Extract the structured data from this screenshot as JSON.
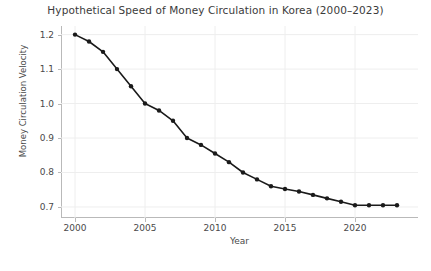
{
  "chart_data": {
    "type": "line",
    "title": "Hypothetical Speed of Money Circulation in Korea (2000–2023)",
    "xlabel": "Year",
    "ylabel": "Money Circulation Velocity",
    "x": [
      2000,
      2001,
      2002,
      2003,
      2004,
      2005,
      2006,
      2007,
      2008,
      2009,
      2010,
      2011,
      2012,
      2013,
      2014,
      2015,
      2016,
      2017,
      2018,
      2019,
      2020,
      2021,
      2022,
      2023
    ],
    "values": [
      1.2,
      1.18,
      1.15,
      1.1,
      1.05,
      1.0,
      0.98,
      0.95,
      0.9,
      0.88,
      0.855,
      0.83,
      0.8,
      0.78,
      0.76,
      0.752,
      0.745,
      0.735,
      0.725,
      0.715,
      0.705,
      0.705,
      0.705,
      0.705
    ],
    "xlim": [
      1999.0,
      2024.5
    ],
    "ylim": [
      0.668,
      1.225
    ],
    "xticks": [
      2000,
      2005,
      2010,
      2015,
      2020
    ],
    "xtick_labels": [
      "2000",
      "2005",
      "2010",
      "2015",
      "2020"
    ],
    "yticks": [
      0.7,
      0.8,
      0.9,
      1.0,
      1.1,
      1.2
    ],
    "ytick_labels": [
      "0.7",
      "0.8",
      "0.9",
      "1.0",
      "1.1",
      "1.2"
    ],
    "grid": true,
    "legend": null,
    "line_color": "#1a1a1a",
    "marker": "circle",
    "marker_color": "#1a1a1a",
    "grid_color": "#eeeeee",
    "background_color": "#ffffff"
  }
}
